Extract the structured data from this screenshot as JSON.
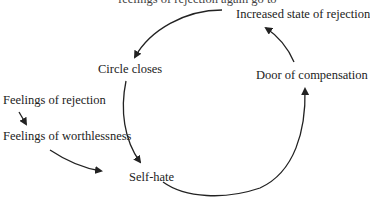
{
  "diagram": {
    "type": "cycle",
    "partial_top_text": "feelings of rejection again go to",
    "nodes": {
      "increased": "Increased state of rejection",
      "circle": "Circle closes",
      "door": "Door of compensation",
      "rejection": "Feelings of rejection",
      "worthlessness": "Feelings of worthlessness",
      "selfhate": "Self-hate"
    },
    "edges": [
      {
        "from": "Feelings of rejection",
        "to": "Feelings of worthlessness"
      },
      {
        "from": "Feelings of worthlessness",
        "to": "Self-hate"
      },
      {
        "from": "Circle closes",
        "to": "Self-hate"
      },
      {
        "from": "Self-hate",
        "to": "Door of compensation"
      },
      {
        "from": "Door of compensation",
        "to": "Increased state of rejection"
      },
      {
        "from": "Increased state of rejection",
        "to": "Circle closes"
      }
    ],
    "colors": {
      "ink": "#222222",
      "background": "#ffffff"
    }
  }
}
